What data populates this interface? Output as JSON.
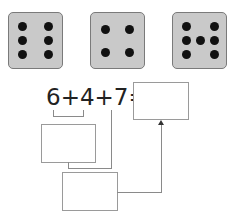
{
  "dice": [
    {
      "value": 6,
      "pips": [
        [
          9,
          9
        ],
        [
          35,
          9
        ],
        [
          9,
          23
        ],
        [
          35,
          23
        ],
        [
          9,
          37
        ],
        [
          35,
          37
        ]
      ]
    },
    {
      "value": 4,
      "pips": [
        [
          10,
          12
        ],
        [
          34,
          12
        ],
        [
          10,
          35
        ],
        [
          34,
          35
        ]
      ]
    },
    {
      "value": 7,
      "pips": [
        [
          9,
          9
        ],
        [
          37,
          9
        ],
        [
          9,
          23
        ],
        [
          23,
          23
        ],
        [
          37,
          23
        ],
        [
          9,
          37
        ],
        [
          37,
          37
        ]
      ]
    }
  ],
  "equation": {
    "text": "6+4+7=",
    "terms": [
      "6",
      "4",
      "7"
    ],
    "operator": "+",
    "equals": "="
  },
  "boxes": {
    "answer": "",
    "partial_sum_6_4": "",
    "partial_sum_total": ""
  },
  "colors": {
    "die_face": "#c9c9c9",
    "die_border": "#7a7a7a",
    "pip": "#111111",
    "box_border": "#9a9a9a",
    "line": "#8a8a8a"
  }
}
